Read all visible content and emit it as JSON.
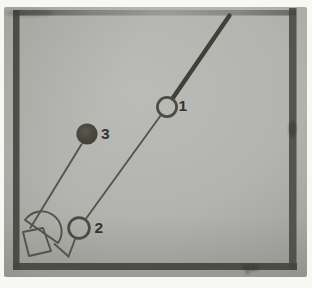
{
  "figure": {
    "markers": {
      "ball1": {
        "label": "1",
        "style": "open-circle"
      },
      "ball2": {
        "label": "2",
        "style": "open-circle"
      },
      "ball3": {
        "label": "3",
        "style": "filled-circle"
      }
    },
    "colors": {
      "page_margin": "#f7f7f4",
      "photo_background": "#b3b3af",
      "frame": "#45453e",
      "stick": "#403f38",
      "ink": "#55544c",
      "circle_stroke": "#4b4a43",
      "ball3_fill": "#45443e",
      "label_ink": "#34342e"
    }
  }
}
